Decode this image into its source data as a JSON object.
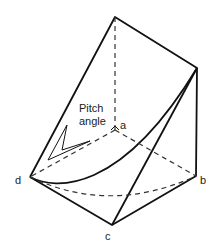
{
  "diagram": {
    "labels": {
      "pitch": "Pitch",
      "angle": "angle",
      "a": "a",
      "b": "b",
      "c": "c",
      "d": "d"
    },
    "colors": {
      "line": "#111111",
      "dashed": "#333333"
    }
  }
}
